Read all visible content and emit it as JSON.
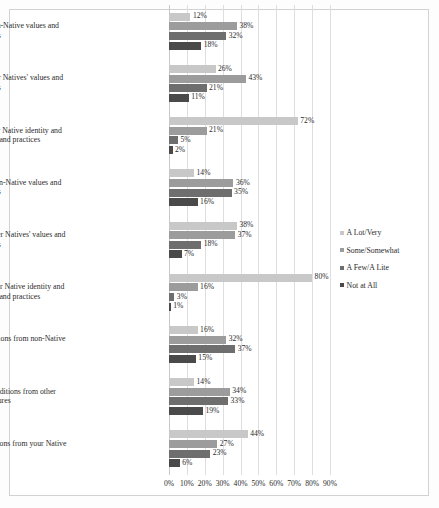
{
  "chart_data": {
    "type": "bar",
    "orientation": "horizontal",
    "title": "",
    "xlabel": "",
    "ylabel": "",
    "xlim": [
      0,
      90
    ],
    "xticks": [
      "0%",
      "10%",
      "20%",
      "30%",
      "40%",
      "50%",
      "60%",
      "70%",
      "80%",
      "90%"
    ],
    "xtick_values": [
      0,
      10,
      20,
      30,
      40,
      50,
      60,
      70,
      80,
      90
    ],
    "grid": true,
    "legend_position": "right",
    "value_suffix": "%",
    "categories": [
      "Family maintenance of non-Native values and practices",
      "Family maintenance of other Natives' values and practices",
      "Family maintenance of your Native identity and your Nation's values and practices",
      "Personal maintenance of non-Native values and practices",
      "Personal maintenance of other Natives' values and practices",
      "Personal maintenance of your Native identity and your Nation's values and practices",
      "Family participation in traditions from non-Native cultures",
      "Family participation in traditions from other Native cultures",
      "Family participation in traditions from your Native culture"
    ],
    "series": [
      {
        "name": "A Lot/Very",
        "color": "#c8c8c8",
        "values": [
          12,
          26,
          72,
          14,
          38,
          80,
          16,
          14,
          44
        ],
        "labels": [
          "12%",
          "26%",
          "72%",
          "14%",
          "38%",
          "80%",
          "16%",
          "14%",
          "44%"
        ]
      },
      {
        "name": "Some/Somewhat",
        "color": "#9c9c9c",
        "values": [
          38,
          43,
          21,
          36,
          37,
          16,
          32,
          34,
          27
        ],
        "labels": [
          "38%",
          "43%",
          "21%",
          "36%",
          "37%",
          "16%",
          "32%",
          "34%",
          "27%"
        ]
      },
      {
        "name": "A Few/A Lite",
        "color": "#6e6e6e",
        "values": [
          32,
          21,
          5,
          35,
          18,
          3,
          37,
          33,
          23
        ],
        "labels": [
          "32%",
          "21%",
          "5%",
          "35%",
          "18%",
          "3%",
          "37%",
          "33%",
          "23%"
        ]
      },
      {
        "name": "Not at All",
        "color": "#4a4a4a",
        "values": [
          18,
          11,
          2,
          16,
          7,
          1,
          15,
          19,
          6
        ],
        "labels": [
          "18%",
          "11%",
          "2%",
          "16%",
          "7%",
          "1%",
          "15%",
          "19%",
          "6%"
        ]
      }
    ]
  }
}
